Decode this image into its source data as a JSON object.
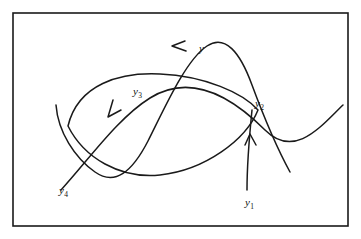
{
  "figure": {
    "kind": "mathematical-diagram",
    "background_color": "#ffffff",
    "stroke_color": "#1a1a1a",
    "frame": {
      "name": "figure-border",
      "x": 13,
      "y": 13,
      "width": 335,
      "height": 213
    },
    "labels": [
      {
        "id": "y",
        "base": "y",
        "sub": "",
        "x": 199,
        "y": 43,
        "name": "curve-label-y"
      },
      {
        "id": "y3",
        "base": "y",
        "sub": "3",
        "x": 133,
        "y": 86,
        "name": "point-label-y3"
      },
      {
        "id": "y2",
        "base": "y",
        "sub": "2",
        "x": 255,
        "y": 98,
        "name": "point-label-y2"
      },
      {
        "id": "y4",
        "base": "y",
        "sub": "4",
        "x": 59,
        "y": 185,
        "name": "point-label-y4"
      },
      {
        "id": "y1",
        "base": "y",
        "sub": "1",
        "x": 245,
        "y": 197,
        "name": "point-label-y1"
      }
    ],
    "curves": [
      {
        "id": "oval-loop",
        "name": "closed-oval-curve",
        "description": "closed oval loop spanning the frame",
        "path": "M 68 126 C 78 84, 120 72, 160 74 C 205 76, 243 93, 258 110 C 246 140, 205 170, 160 175 C 120 179, 84 158, 68 126 Z"
      },
      {
        "id": "tall-arc",
        "name": "tall-arch-curve",
        "description": "tall inverted-U curve from left endpoint up over the top and down to lower right",
        "path": "M 56 105 C 58 132, 75 158, 95 172 C 115 186, 132 172, 148 141 C 166 105, 186 60, 207 46 C 225 34, 240 52, 252 85 C 262 112, 278 150, 290 172"
      },
      {
        "id": "rising-curve",
        "name": "rising-diagonal-curve",
        "description": "curve rising from lower left to upper right, through y3 and y2",
        "path": "M 61 190 C 90 158, 118 118, 150 98 C 190 73, 230 95, 265 130 C 295 160, 322 125, 343 105"
      },
      {
        "id": "vertical-segment-y1",
        "name": "vertical-segment-to-y2",
        "description": "near-vertical line from y1 at bottom rising to y2",
        "path": "M 247 190 C 247 170, 249 140, 252 110"
      }
    ],
    "arrows": [
      {
        "id": "arrow-top",
        "name": "arrowhead-leftward-top",
        "direction": "left",
        "description": "arrowhead on the upper arc pointing left",
        "path": "M 185 41 L 172 46 L 186 51"
      },
      {
        "id": "arrow-descending",
        "name": "arrowhead-down-left",
        "direction": "down-left",
        "description": "arrowhead on the descending diagonal pointing down-left",
        "path": "M 113 100 L 108 117 L 121 110"
      },
      {
        "id": "arrow-vertical",
        "name": "arrowhead-upward",
        "direction": "up",
        "description": "arrowhead on the vertical segment pointing up toward y2",
        "path": "M 245 145 L 250 134 L 256 145"
      }
    ]
  }
}
